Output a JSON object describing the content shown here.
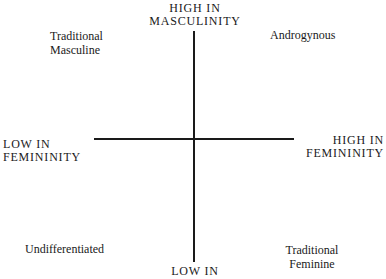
{
  "diagram": {
    "type": "quadrant",
    "axes": {
      "vertical": {
        "top_label": [
          "High in",
          "Masculinity"
        ],
        "bottom_label": [
          "Low in"
        ]
      },
      "horizontal": {
        "left_label": [
          "Low in",
          "Femininity"
        ],
        "right_label": [
          "High in",
          "Femininity"
        ]
      }
    },
    "quadrants": {
      "top_left": [
        "Traditional",
        "Masculine"
      ],
      "top_right": [
        "Androgynous"
      ],
      "bottom_left": [
        "Undifferentiated"
      ],
      "bottom_right": [
        "Traditional",
        "Feminine"
      ]
    },
    "colors": {
      "line": "#1a1a1a",
      "text": "#1a1a1a",
      "background": "#ffffff"
    }
  }
}
